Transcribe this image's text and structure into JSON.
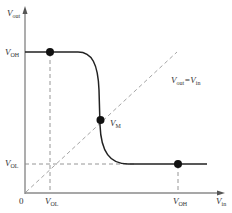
{
  "diagram": {
    "y_axis": {
      "label_main": "V",
      "label_sub": "out"
    },
    "x_axis": {
      "label_main": "V",
      "label_sub": "in"
    },
    "origin_label": "0",
    "y_ticks": [
      {
        "main": "V",
        "sub": "OH"
      },
      {
        "main": "V",
        "sub": "OL"
      }
    ],
    "x_ticks": [
      {
        "main": "V",
        "sub": "OL"
      },
      {
        "main": "V",
        "sub": "OH"
      }
    ],
    "points": [
      {
        "name": "VOH point"
      },
      {
        "main": "V",
        "sub": "M"
      },
      {
        "name": "VOL point"
      }
    ],
    "diagonal_label": {
      "left_main": "V",
      "left_sub": "out",
      "eq": "=",
      "right_main": "V",
      "right_sub": "in"
    },
    "colors": {
      "curve": "#222222",
      "axis": "#888888",
      "dashed": "#999999",
      "dot": "#111111"
    }
  }
}
